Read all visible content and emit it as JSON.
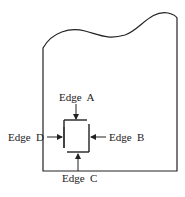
{
  "diagram": {
    "labels": {
      "edge_a": "Edge  A",
      "edge_b": "Edge  B",
      "edge_c": "Edge  C",
      "edge_d": "Edge  D"
    },
    "colors": {
      "stroke": "#222222",
      "background": "#ffffff"
    }
  }
}
